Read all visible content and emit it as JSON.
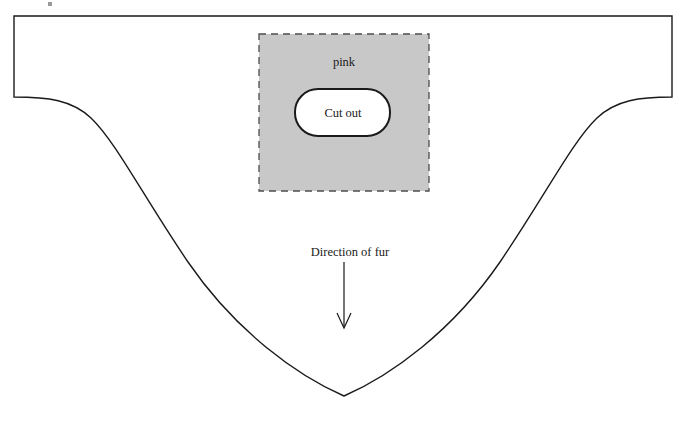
{
  "figure": {
    "type": "sewing-pattern-diagram",
    "background_color": "#ffffff",
    "line_color": "#1a1a1a",
    "fabric_fill_color": "#c8c8c8",
    "cutout_fill_color": "#ffffff"
  },
  "labels": {
    "fabric_region": "pink",
    "cutout_shape": "Cut out",
    "fur_direction": "Direction of fur"
  },
  "icons": {
    "down_arrow": "down-arrow-icon"
  },
  "geometry": {
    "outline": {
      "top_y": 16,
      "left_x": 14,
      "right_x": 672,
      "shoulder_y": 97,
      "apex_x": 344,
      "apex_y": 396
    },
    "fabric_rect": {
      "x": 259,
      "y": 34,
      "width": 170,
      "height": 157
    },
    "cutout_rect": {
      "x": 295,
      "y": 89,
      "width": 95,
      "height": 47,
      "corner_radius": 23
    },
    "arrow": {
      "x": 344,
      "y_start": 262,
      "y_end": 327
    }
  }
}
